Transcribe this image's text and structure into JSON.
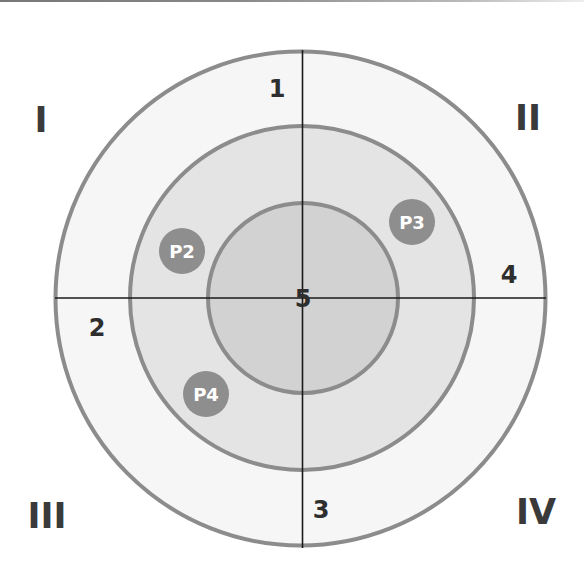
{
  "diagram": {
    "type": "concentric-target-quadrants",
    "center": {
      "x": 301,
      "y": 298
    },
    "rings": [
      {
        "name": "outer",
        "r": 246,
        "fill": "#f6f6f6",
        "stroke": "#8c8c8c"
      },
      {
        "name": "middle",
        "r": 172,
        "fill": "#e4e4e4",
        "stroke": "#8c8c8c"
      },
      {
        "name": "inner",
        "r": 95,
        "fill": "#d2d2d2",
        "stroke": "#8c8c8c"
      }
    ],
    "axis_color": "#1a1a1a",
    "quadrants": [
      {
        "id": "q1",
        "label": "I"
      },
      {
        "id": "q2",
        "label": "II"
      },
      {
        "id": "q3",
        "label": "III"
      },
      {
        "id": "q4",
        "label": "IV"
      }
    ],
    "zone_labels": [
      {
        "id": "z1",
        "label": "1"
      },
      {
        "id": "z2",
        "label": "2"
      },
      {
        "id": "z3",
        "label": "3"
      },
      {
        "id": "z4",
        "label": "4"
      },
      {
        "id": "z5",
        "label": "5"
      }
    ],
    "points": [
      {
        "id": "p2",
        "label": "P2",
        "fill": "#8e8e8e"
      },
      {
        "id": "p3",
        "label": "P3",
        "fill": "#8e8e8e"
      },
      {
        "id": "p4",
        "label": "P4",
        "fill": "#8e8e8e"
      }
    ]
  }
}
